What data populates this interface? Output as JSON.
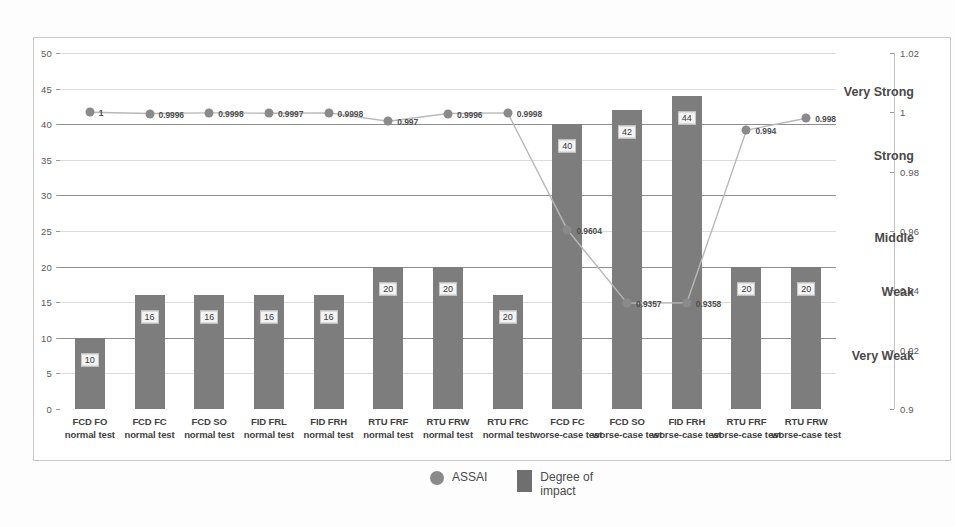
{
  "chart_data": {
    "type": "bar",
    "title": "",
    "subtitle": "",
    "xlabel": "",
    "ylabel": "",
    "grid": true,
    "legend_position": "bottom",
    "categories": [
      "FCD FO\nnormal test",
      "FCD FC\nnormal test",
      "FCD SO\nnormal test",
      "FID FRL\nnormal test",
      "FID FRH\nnormal test",
      "RTU FRF\nnormal test",
      "RTU FRW\nnormal test",
      "RTU FRC\nnormal test",
      "FCD FC\nworse-case test",
      "FCD SO\nworse-case test",
      "FID FRH\nworse-case test",
      "RTU FRF\nworse-case test",
      "RTU FRW\nworse-case test"
    ],
    "series": [
      {
        "name": "Degree of impact",
        "type": "bar",
        "axis": "left",
        "color": "#7d7d7d",
        "values": [
          10,
          16,
          16,
          16,
          16,
          20,
          20,
          16,
          40,
          42,
          44,
          20,
          20
        ],
        "labels": [
          "10",
          "16",
          "16",
          "16",
          "16",
          "20",
          "20",
          "20",
          "40",
          "42",
          "44",
          "20",
          "20"
        ]
      },
      {
        "name": "ASSAI",
        "type": "line",
        "axis": "right",
        "color": "#8a8a8a",
        "values": [
          1,
          0.9996,
          0.9998,
          0.9997,
          0.9998,
          0.997,
          0.9996,
          0.9998,
          0.9604,
          0.9357,
          0.9358,
          0.994,
          0.998
        ],
        "labels": [
          "1",
          "0.9996",
          "0.9998",
          "0.9997",
          "0.9998",
          "0.997",
          "0.9996",
          "0.9998",
          "0.9604",
          "0.9357",
          "0.9358",
          "0.994",
          "0.998"
        ]
      }
    ],
    "left_axis": {
      "min": 0,
      "max": 50,
      "ticks": [
        0,
        5,
        10,
        15,
        20,
        25,
        30,
        35,
        40,
        45,
        50
      ],
      "tick_labels": [
        "0",
        "5",
        "10",
        "15",
        "20",
        "25",
        "30",
        "35",
        "40",
        "45",
        "50"
      ]
    },
    "right_axis": {
      "min": 0.9,
      "max": 1.02,
      "ticks": [
        0.9,
        0.92,
        0.94,
        0.96,
        0.98,
        1,
        1.02
      ],
      "tick_labels": [
        "0.9",
        "0.92",
        "0.94",
        "0.96",
        "0.98",
        "1",
        "1.02"
      ]
    },
    "threshold_lines": [
      {
        "left_value": 40,
        "label": "Very Strong"
      },
      {
        "left_value": 30,
        "label": "Strong"
      },
      {
        "left_value": 20,
        "label": "Middle"
      },
      {
        "left_value": 10,
        "label": "Weak"
      }
    ],
    "band_labels": [
      {
        "text": "Very Strong",
        "left_value": 44.5
      },
      {
        "text": "Strong",
        "left_value": 35.5
      },
      {
        "text": "Middle",
        "left_value": 24.0
      },
      {
        "text": "Weak",
        "left_value": 16.5
      },
      {
        "text": "Very Weak",
        "left_value": 7.5
      }
    ],
    "legend": [
      {
        "label": "ASSAI",
        "marker": "circle",
        "color": "#8a8a8a"
      },
      {
        "label": "Degree of impact",
        "marker": "square",
        "color": "#6f6f6f"
      }
    ]
  }
}
